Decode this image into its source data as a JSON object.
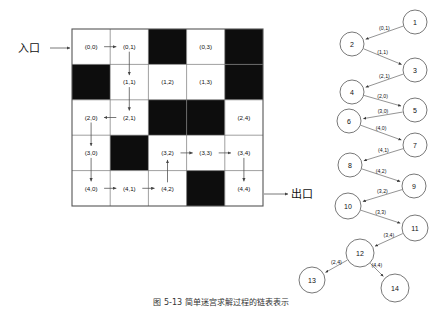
{
  "figure": {
    "caption": "图 5-13  简单迷宫求解过程的链表表示",
    "entrance_label": "入口",
    "exit_label": "出口"
  },
  "maze": {
    "rows": 5,
    "cols": 5,
    "grid": [
      [
        {
          "label": "(0,0)",
          "blocked": false
        },
        {
          "label": "(0,1)",
          "blocked": false
        },
        {
          "label": "",
          "blocked": true
        },
        {
          "label": "(0,3)",
          "blocked": false
        },
        {
          "label": "",
          "blocked": true
        }
      ],
      [
        {
          "label": "",
          "blocked": true
        },
        {
          "label": "(1,1)",
          "blocked": false
        },
        {
          "label": "(1,2)",
          "blocked": false
        },
        {
          "label": "(1,3)",
          "blocked": false
        },
        {
          "label": "",
          "blocked": true
        }
      ],
      [
        {
          "label": "(2,0)",
          "blocked": false
        },
        {
          "label": "(2,1)",
          "blocked": false
        },
        {
          "label": "",
          "blocked": true
        },
        {
          "label": "",
          "blocked": true
        },
        {
          "label": "(2,4)",
          "blocked": false
        }
      ],
      [
        {
          "label": "(3,0)",
          "blocked": false
        },
        {
          "label": "",
          "blocked": true
        },
        {
          "label": "(3,2)",
          "blocked": false
        },
        {
          "label": "(3,3)",
          "blocked": false
        },
        {
          "label": "(3,4)",
          "blocked": false
        }
      ],
      [
        {
          "label": "(4,0)",
          "blocked": false
        },
        {
          "label": "(4,1)",
          "blocked": false
        },
        {
          "label": "(4,2)",
          "blocked": false
        },
        {
          "label": "",
          "blocked": true
        },
        {
          "label": "(4,4)",
          "blocked": false
        }
      ]
    ],
    "path_arrows": [
      {
        "from": "(0,0)",
        "to": "(0,1)",
        "dir": "right"
      },
      {
        "from": "(0,1)",
        "to": "(1,1)",
        "dir": "down"
      },
      {
        "from": "(1,1)",
        "to": "(2,1)",
        "dir": "down"
      },
      {
        "from": "(2,1)",
        "to": "(2,0)",
        "dir": "left"
      },
      {
        "from": "(2,0)",
        "to": "(3,0)",
        "dir": "down"
      },
      {
        "from": "(3,0)",
        "to": "(4,0)",
        "dir": "down"
      },
      {
        "from": "(4,0)",
        "to": "(4,1)",
        "dir": "right"
      },
      {
        "from": "(4,1)",
        "to": "(4,2)",
        "dir": "right"
      },
      {
        "from": "(4,2)",
        "to": "(3,2)",
        "dir": "up"
      },
      {
        "from": "(3,2)",
        "to": "(3,3)",
        "dir": "right"
      },
      {
        "from": "(3,3)",
        "to": "(3,4)",
        "dir": "right"
      },
      {
        "from": "(3,4)",
        "to": "(4,4)",
        "dir": "down"
      }
    ]
  },
  "linked_list": {
    "nodes": [
      {
        "id": "1",
        "cx": 415,
        "cy": 22,
        "r": 12
      },
      {
        "id": "2",
        "cx": 352,
        "cy": 44,
        "r": 12
      },
      {
        "id": "3",
        "cx": 415,
        "cy": 70,
        "r": 12
      },
      {
        "id": "4",
        "cx": 352,
        "cy": 92,
        "r": 12
      },
      {
        "id": "5",
        "cx": 415,
        "cy": 110,
        "r": 12
      },
      {
        "id": "6",
        "cx": 349,
        "cy": 121,
        "r": 12
      },
      {
        "id": "7",
        "cx": 415,
        "cy": 145,
        "r": 12
      },
      {
        "id": "8",
        "cx": 350,
        "cy": 165,
        "r": 12
      },
      {
        "id": "9",
        "cx": 414,
        "cy": 186,
        "r": 12
      },
      {
        "id": "10",
        "cx": 348,
        "cy": 206,
        "r": 13
      },
      {
        "id": "11",
        "cx": 415,
        "cy": 228,
        "r": 13
      },
      {
        "id": "12",
        "cx": 360,
        "cy": 253,
        "r": 14
      },
      {
        "id": "13",
        "cx": 312,
        "cy": 280,
        "r": 13
      },
      {
        "id": "14",
        "cx": 395,
        "cy": 288,
        "r": 14
      }
    ],
    "edges": [
      {
        "from": "1",
        "to": "2",
        "label": "(0,1)"
      },
      {
        "from": "2",
        "to": "3",
        "label": "(1,1)"
      },
      {
        "from": "3",
        "to": "4",
        "label": "(2,1)"
      },
      {
        "from": "4",
        "to": "5",
        "label": "(2,0)"
      },
      {
        "from": "5",
        "to": "6",
        "label": "(3,0)"
      },
      {
        "from": "6",
        "to": "7",
        "label": "(4,0)"
      },
      {
        "from": "7",
        "to": "8",
        "label": "(4,1)"
      },
      {
        "from": "8",
        "to": "9",
        "label": "(4,2)"
      },
      {
        "from": "9",
        "to": "10",
        "label": "(3,2)"
      },
      {
        "from": "10",
        "to": "11",
        "label": "(3,3)"
      },
      {
        "from": "11",
        "to": "12",
        "label": "(3,4)"
      },
      {
        "from": "12",
        "to": "13",
        "label": "(2,4)"
      },
      {
        "from": "12",
        "to": "14",
        "label": "(4,4)"
      }
    ]
  }
}
